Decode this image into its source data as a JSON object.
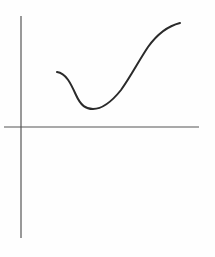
{
  "figure": {
    "colors": {
      "background": "#fefefe",
      "axis": "#555555",
      "curve": "#2a2a2a"
    },
    "axes": {
      "x_axis": {
        "x1": 4,
        "y1": 127,
        "x2": 199,
        "y2": 127
      },
      "y_axis": {
        "x1": 21,
        "y1": 16,
        "x2": 21,
        "y2": 238
      }
    },
    "curve": {
      "start": [
        57,
        72
      ],
      "local_minimum": [
        93,
        109
      ],
      "end": [
        180,
        23
      ],
      "path": "M57,72 C66,73 71,84 76,95 C81,106 86,109 93,109 C104,109 113,100 121,90 C131,76 138,62 148,47 C158,33 168,26 180,23"
    }
  }
}
